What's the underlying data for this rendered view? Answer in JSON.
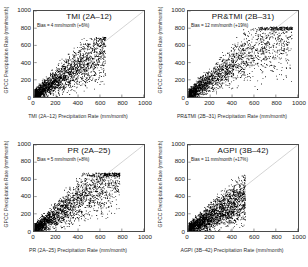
{
  "figure": {
    "axis_label_y": "GPCC Precipitation Rate (mm/month)",
    "tick_labels": [
      "0",
      "200",
      "400",
      "600",
      "800",
      "1000"
    ]
  },
  "chart_data": [
    {
      "type": "scatter",
      "title": "TMI (2A–12)",
      "annotation": "Bias = 4 mm/month (+6%)",
      "xlabel": "TMI (2A–12) Precipitation Rate (mm/month)",
      "ylabel": "GPCC Precipitation Rate (mm/month)",
      "xlim": [
        0,
        1000
      ],
      "ylim": [
        0,
        1000
      ],
      "xticks": [
        0,
        200,
        400,
        600,
        800,
        1000
      ],
      "yticks": [
        0,
        200,
        400,
        600,
        800,
        1000
      ],
      "grid": false,
      "reference_line": "1:1 identity line",
      "reference_line_color": "#c8c8c8",
      "marker_color": "#000000",
      "bias_mm_per_month": 4,
      "bias_percent": 6,
      "n_points": 2400,
      "cluster": {
        "x_max": 650,
        "y_max": 700,
        "core_x": 300,
        "core_y": 280,
        "spread": 0.82,
        "tail": 1.6
      }
    },
    {
      "type": "scatter",
      "title": "PR&TMI (2B–31)",
      "annotation": "Bias = 12 mm/month (+19%)",
      "xlabel": "PR&TMI (2B–31) Precipitation Rate (mm/month)",
      "ylabel": "GPCC Precipitation Rate (mm/month)",
      "xlim": [
        0,
        1000
      ],
      "ylim": [
        0,
        1000
      ],
      "xticks": [
        0,
        200,
        400,
        600,
        800,
        1000
      ],
      "yticks": [
        0,
        200,
        400,
        600,
        800,
        1000
      ],
      "grid": false,
      "reference_line": "1:1 identity line",
      "reference_line_color": "#c8c8c8",
      "marker_color": "#000000",
      "bias_mm_per_month": 12,
      "bias_percent": 19,
      "n_points": 2400,
      "cluster": {
        "x_max": 950,
        "y_max": 820,
        "core_x": 290,
        "core_y": 270,
        "spread": 0.86,
        "tail": 1.9
      }
    },
    {
      "type": "scatter",
      "title": "PR (2A–25)",
      "annotation": "Bias = 5 mm/month (+8%)",
      "xlabel": "PR (2A–25) Precipitation Rate (mm/month)",
      "ylabel": "GPCC Precipitation Rate (mm/month)",
      "xlim": [
        0,
        1000
      ],
      "ylim": [
        0,
        1000
      ],
      "xticks": [
        0,
        200,
        400,
        600,
        800,
        1000
      ],
      "yticks": [
        0,
        200,
        400,
        600,
        800,
        1000
      ],
      "grid": false,
      "reference_line": "1:1 identity line",
      "reference_line_color": "#c8c8c8",
      "marker_color": "#000000",
      "bias_mm_per_month": 5,
      "bias_percent": 8,
      "n_points": 2400,
      "cluster": {
        "x_max": 780,
        "y_max": 680,
        "core_x": 270,
        "core_y": 265,
        "spread": 0.84,
        "tail": 1.7
      }
    },
    {
      "type": "scatter",
      "title": "AGPI (3B–42)",
      "annotation": "Bias = 11 mm/month (+17%)",
      "xlabel": "AGPI (3B–42) Precipitation Rate (mm/month)",
      "ylabel": "GPCC Precipitation Rate (mm/month)",
      "xlim": [
        0,
        1000
      ],
      "ylim": [
        0,
        1000
      ],
      "xticks": [
        0,
        200,
        400,
        600,
        800,
        1000
      ],
      "yticks": [
        0,
        200,
        400,
        600,
        800,
        1000
      ],
      "grid": false,
      "reference_line": "1:1 identity line",
      "reference_line_color": "#c8c8c8",
      "marker_color": "#000000",
      "bias_mm_per_month": 11,
      "bias_percent": 17,
      "n_points": 2400,
      "cluster": {
        "x_max": 520,
        "y_max": 660,
        "core_x": 250,
        "core_y": 300,
        "spread": 0.7,
        "tail": 1.3
      }
    }
  ]
}
